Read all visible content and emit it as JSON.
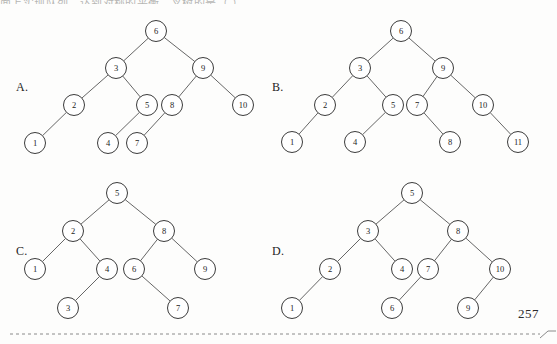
{
  "document": {
    "page_number": "257",
    "top_partial_text": "面上实现队列，达到对称的平衡二叉树的是（ ）。",
    "choice_labels": [
      "A.",
      "B.",
      "C.",
      "D."
    ]
  },
  "chart_data": {
    "type": "diagram",
    "trees": [
      {
        "id": "A",
        "label": "A.",
        "label_pos": {
          "x": 16,
          "y": 80
        },
        "nodes": [
          {
            "value": "6",
            "x": 156,
            "y": 31
          },
          {
            "value": "3",
            "x": 116,
            "y": 68
          },
          {
            "value": "9",
            "x": 203,
            "y": 68
          },
          {
            "value": "2",
            "x": 74,
            "y": 105
          },
          {
            "value": "5",
            "x": 147,
            "y": 105
          },
          {
            "value": "8",
            "x": 172,
            "y": 105
          },
          {
            "value": "10",
            "x": 243,
            "y": 105
          },
          {
            "value": "1",
            "x": 35,
            "y": 143
          },
          {
            "value": "4",
            "x": 108,
            "y": 143
          },
          {
            "value": "7",
            "x": 137,
            "y": 143
          }
        ],
        "edges": [
          [
            "6",
            "3"
          ],
          [
            "6",
            "9"
          ],
          [
            "3",
            "2"
          ],
          [
            "3",
            "5"
          ],
          [
            "9",
            "8"
          ],
          [
            "9",
            "10"
          ],
          [
            "2",
            "1"
          ],
          [
            "5",
            "4"
          ],
          [
            "8",
            "7"
          ]
        ]
      },
      {
        "id": "B",
        "label": "B.",
        "label_pos": {
          "x": 272,
          "y": 80
        },
        "nodes": [
          {
            "value": "6",
            "x": 401,
            "y": 31
          },
          {
            "value": "3",
            "x": 360,
            "y": 68
          },
          {
            "value": "9",
            "x": 443,
            "y": 68
          },
          {
            "value": "2",
            "x": 325,
            "y": 105
          },
          {
            "value": "5",
            "x": 393,
            "y": 105
          },
          {
            "value": "7",
            "x": 417,
            "y": 105
          },
          {
            "value": "10",
            "x": 483,
            "y": 105
          },
          {
            "value": "1",
            "x": 292,
            "y": 142
          },
          {
            "value": "4",
            "x": 355,
            "y": 142
          },
          {
            "value": "8",
            "x": 450,
            "y": 142
          },
          {
            "value": "11",
            "x": 518,
            "y": 142
          }
        ],
        "edges": [
          [
            "6",
            "3"
          ],
          [
            "6",
            "9"
          ],
          [
            "3",
            "2"
          ],
          [
            "3",
            "5"
          ],
          [
            "9",
            "7"
          ],
          [
            "9",
            "10"
          ],
          [
            "2",
            "1"
          ],
          [
            "5",
            "4"
          ],
          [
            "7",
            "8"
          ],
          [
            "10",
            "11"
          ]
        ]
      },
      {
        "id": "C",
        "label": "C.",
        "label_pos": {
          "x": 16,
          "y": 244
        },
        "nodes": [
          {
            "value": "5",
            "x": 117,
            "y": 193
          },
          {
            "value": "2",
            "x": 73,
            "y": 231
          },
          {
            "value": "8",
            "x": 164,
            "y": 231
          },
          {
            "value": "1",
            "x": 35,
            "y": 269
          },
          {
            "value": "4",
            "x": 107,
            "y": 269
          },
          {
            "value": "6",
            "x": 134,
            "y": 269
          },
          {
            "value": "9",
            "x": 205,
            "y": 269
          },
          {
            "value": "3",
            "x": 68,
            "y": 308
          },
          {
            "value": "7",
            "x": 178,
            "y": 308
          }
        ],
        "edges": [
          [
            "5",
            "2"
          ],
          [
            "5",
            "8"
          ],
          [
            "2",
            "1"
          ],
          [
            "2",
            "4"
          ],
          [
            "8",
            "6"
          ],
          [
            "8",
            "9"
          ],
          [
            "4",
            "3"
          ],
          [
            "6",
            "7"
          ]
        ]
      },
      {
        "id": "D",
        "label": "D.",
        "label_pos": {
          "x": 272,
          "y": 244
        },
        "nodes": [
          {
            "value": "5",
            "x": 412,
            "y": 193
          },
          {
            "value": "3",
            "x": 368,
            "y": 231
          },
          {
            "value": "8",
            "x": 458,
            "y": 231
          },
          {
            "value": "2",
            "x": 330,
            "y": 269
          },
          {
            "value": "4",
            "x": 402,
            "y": 269
          },
          {
            "value": "7",
            "x": 428,
            "y": 269
          },
          {
            "value": "10",
            "x": 500,
            "y": 269
          },
          {
            "value": "1",
            "x": 292,
            "y": 308
          },
          {
            "value": "6",
            "x": 392,
            "y": 308
          },
          {
            "value": "9",
            "x": 468,
            "y": 308
          }
        ],
        "edges": [
          [
            "5",
            "3"
          ],
          [
            "5",
            "8"
          ],
          [
            "3",
            "2"
          ],
          [
            "3",
            "4"
          ],
          [
            "8",
            "7"
          ],
          [
            "8",
            "10"
          ],
          [
            "2",
            "1"
          ],
          [
            "7",
            "6"
          ],
          [
            "10",
            "9"
          ]
        ]
      }
    ],
    "footer_rule": {
      "y": 334,
      "x1": 10,
      "x2": 548,
      "style": "dashed"
    }
  },
  "colors": {
    "node_stroke": "#3b3b3b",
    "edge_stroke": "#555555",
    "text": "#1d1d1d",
    "background": "#fdfdfc",
    "rule": "#8a8a8a"
  }
}
